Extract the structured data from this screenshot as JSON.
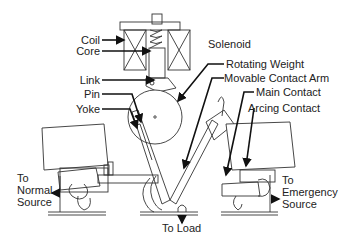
{
  "diagram": {
    "type": "automatic-transfer-switch-mechanism",
    "labels": {
      "coil": "Coil",
      "core": "Core",
      "link": "Link",
      "pin": "Pin",
      "yoke": "Yoke",
      "solenoid": "Solenoid",
      "rotating_weight": "Rotating Weight",
      "movable_contact_arm": "Movable Contact Arm",
      "main_contact": "Main Contact",
      "arcing_contact": "Arcing Contact",
      "normal_source": [
        "To",
        "Normal",
        "Source"
      ],
      "emergency_source": [
        "To",
        "Emergency",
        "Source"
      ],
      "load": "To Load"
    },
    "colors": {
      "line": "#333333",
      "leader": "#111111",
      "text": "#222222",
      "background": "#ffffff"
    }
  }
}
